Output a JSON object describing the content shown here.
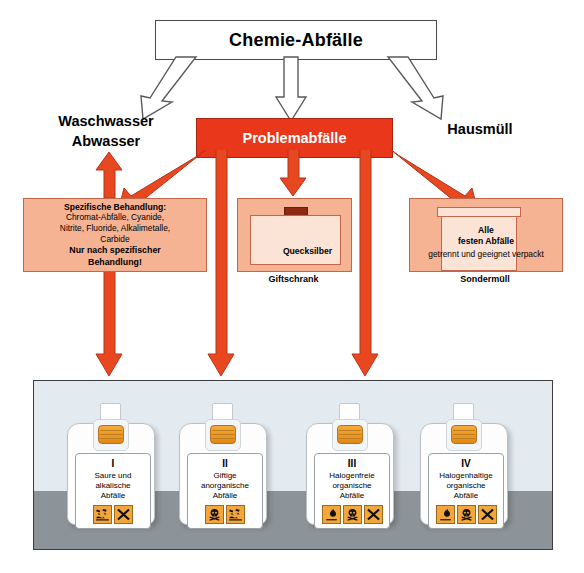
{
  "title": {
    "text": "Chemie-Abfälle"
  },
  "outputs": {
    "left": "Waschwasser\nAbwasser",
    "left_line1": "Waschwasser",
    "left_line2": "Abwasser",
    "center": "Problemabfälle",
    "right": "Hausmüll"
  },
  "boxes": {
    "specific": {
      "heading": "Spezifische Behandlung:",
      "body_line1": "Chromat-Abfälle, Cyanide,",
      "body_line2": "Nitrite, Fluoride, Alkalimetalle,",
      "body_line3": "Carbide",
      "note_line1": "Nur nach spezifischer",
      "note_line2": "Behandlung!"
    },
    "mercury": {
      "container_label": "Quecksilber",
      "caption": "Giftschrank"
    },
    "solids": {
      "drum_line1": "Alle",
      "drum_line2": "festen Abfälle",
      "subtitle": "getrennt und geeignet verpackt",
      "caption": "Sondermüll"
    }
  },
  "canisters": [
    {
      "roman": "I",
      "line1": "Saure und",
      "line2": "alkalische",
      "line3": "Abfälle",
      "pictograms": [
        "corrosive-icon",
        "harmful-x-icon"
      ]
    },
    {
      "roman": "II",
      "line1": "Giftige",
      "line2": "anorganische",
      "line3": "Abfälle",
      "pictograms": [
        "toxic-skull-icon",
        "corrosive-icon"
      ]
    },
    {
      "roman": "III",
      "line1": "Halogenfreie",
      "line2": "organische",
      "line3": "Abfälle",
      "pictograms": [
        "flammable-flame-icon",
        "toxic-skull-icon",
        "harmful-x-icon"
      ]
    },
    {
      "roman": "IV",
      "line1": "Halogenhaltige",
      "line2": "organische",
      "line3": "Abfälle",
      "pictograms": [
        "flammable-flame-icon",
        "toxic-skull-icon",
        "harmful-x-icon"
      ]
    }
  ],
  "colors": {
    "red": "#e8371a",
    "red_arrow": "#e8481f",
    "peach": "#f6b394",
    "peach_light": "#fbe3d5",
    "pictogram_orange": "#f3a63c",
    "panel_sky": "#e3eaf0",
    "panel_floor": "#8d9499"
  }
}
